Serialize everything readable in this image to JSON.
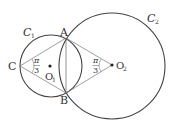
{
  "diagram": {
    "labels": {
      "A": "A",
      "B": "B",
      "C": "C",
      "O1": "O",
      "O1_sub": "1",
      "O2": "O",
      "O2_sub": "2",
      "C1": "C",
      "C1_sub": "1",
      "C2": "C",
      "C2_sub": "2",
      "angle_C_num": "π",
      "angle_C_den": "3",
      "angle_O2_num": "π",
      "angle_O2_den": "3"
    },
    "colors": {
      "stroke": "#444444",
      "thin": "#777777",
      "text": "#333333"
    }
  }
}
